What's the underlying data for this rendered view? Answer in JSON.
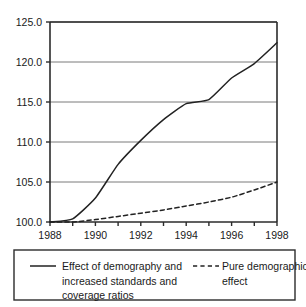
{
  "chart_data": {
    "type": "line",
    "title": "",
    "subtitle": "",
    "xlabel": "",
    "ylabel": "",
    "xlim": [
      1988,
      1998
    ],
    "ylim": [
      100.0,
      125.0
    ],
    "grid": "horizontal",
    "legend_position": "below",
    "x": [
      1988,
      1989,
      1990,
      1991,
      1992,
      1993,
      1994,
      1995,
      1996,
      1997,
      1998
    ],
    "xtick_labels": [
      "1988",
      "1990",
      "1992",
      "1994",
      "1996",
      "1998"
    ],
    "xtick_values": [
      1988,
      1990,
      1992,
      1994,
      1996,
      1998
    ],
    "ytick_labels": [
      "100.0",
      "105.0",
      "110.0",
      "115.0",
      "120.0",
      "125.0"
    ],
    "ytick_values": [
      100.0,
      105.0,
      110.0,
      115.0,
      120.0,
      125.0
    ],
    "series": [
      {
        "name": "Effect of demography and increased standards and coverage ratios",
        "style": "solid",
        "color": "#222222",
        "values": [
          100.0,
          100.4,
          103.0,
          107.2,
          110.2,
          112.8,
          114.8,
          115.3,
          118.0,
          119.8,
          122.4
        ]
      },
      {
        "name": "Pure demographic effect",
        "style": "dashed",
        "color": "#222222",
        "values": [
          100.0,
          100.0,
          100.3,
          100.7,
          101.1,
          101.5,
          102.0,
          102.5,
          103.1,
          104.0,
          105.0
        ]
      }
    ]
  },
  "legend": {
    "entries": [
      {
        "marker": "solid-line-swatch",
        "lines": [
          "Effect of demography and",
          "increased standards and",
          "coverage ratios"
        ]
      },
      {
        "marker": "dashed-line-swatch",
        "lines": [
          "Pure demographic",
          "effect"
        ]
      }
    ]
  },
  "colors": {
    "axis": "#2b2b2b",
    "grid": "#7a7a7a",
    "series": "#222222",
    "legend_border": "#2b2b2b",
    "background": "#ffffff"
  }
}
